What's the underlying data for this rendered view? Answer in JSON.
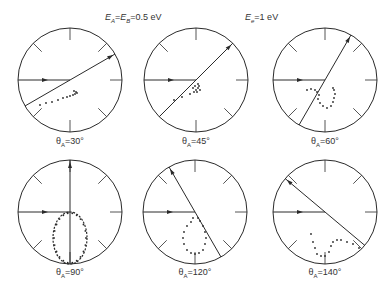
{
  "header": {
    "energy_AB": "E_A = E_B = 0.5 eV",
    "energy_AB_parts": {
      "E": "E",
      "subA": "A",
      "eq": "=",
      "subB": "B",
      "val": "=0.5 eV"
    },
    "energy_e": "E_e = 1 eV",
    "energy_e_parts": {
      "E": "E",
      "sub": "e",
      "val": "=1 eV"
    }
  },
  "panels": [
    {
      "label": "θA=30°",
      "theta_pre": "θ",
      "sub": "A",
      "value": "=30°",
      "theta_deg": 30,
      "cx": 70,
      "cy": 80
    },
    {
      "label": "θA=45°",
      "theta_pre": "θ",
      "sub": "A",
      "value": "=45°",
      "theta_deg": 45,
      "cx": 196,
      "cy": 80
    },
    {
      "label": "θA=60°",
      "theta_pre": "θ",
      "sub": "A",
      "value": "=60°",
      "theta_deg": 60,
      "cx": 325,
      "cy": 80
    },
    {
      "label": "θA=90°",
      "theta_pre": "θ",
      "sub": "A",
      "value": "=90°",
      "theta_deg": 90,
      "cx": 70,
      "cy": 212
    },
    {
      "label": "θA=120°",
      "theta_pre": "θ",
      "sub": "A",
      "value": "=120°",
      "theta_deg": 120,
      "cx": 195,
      "cy": 212
    },
    {
      "label": "θA=140°",
      "theta_pre": "θ",
      "sub": "A",
      "value": "=140°",
      "theta_deg": 140,
      "cx": 325,
      "cy": 212
    }
  ],
  "style": {
    "ink": "#2a2a2a",
    "background": "#ffffff"
  }
}
